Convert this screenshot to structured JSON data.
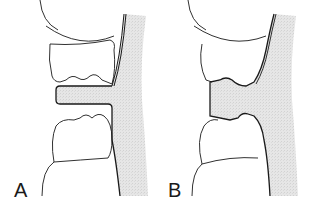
{
  "figure": {
    "panels": [
      {
        "id": "A",
        "label": "A",
        "description": "Flat bite registration / material tab between upper and lower teeth"
      },
      {
        "id": "B",
        "label": "B",
        "description": "Material conforming to occlusal surfaces between upper and lower teeth"
      }
    ],
    "colors": {
      "line": "#1a1a1a",
      "shading": "#e4e4e4",
      "background": "#ffffff"
    }
  }
}
